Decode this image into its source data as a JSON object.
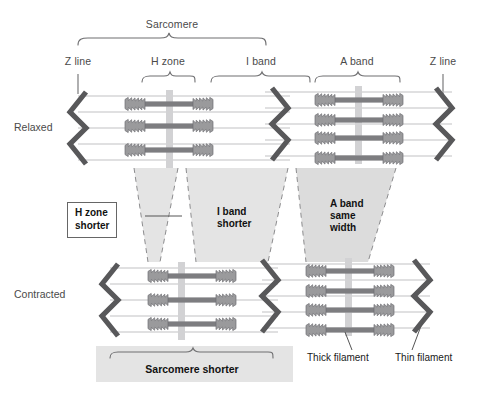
{
  "figure": {
    "top_label": "Sarcomere",
    "region_labels": {
      "z_line_left": "Z line",
      "h_zone": "H zone",
      "i_band": "I band",
      "a_band": "A band",
      "z_line_right": "Z line"
    },
    "row_labels": {
      "relaxed": "Relaxed",
      "contracted": "Contracted"
    },
    "callouts": [
      {
        "id": "h-zone-shorter",
        "text_line1": "H zone",
        "text_line2": "shorter",
        "boxed": true
      },
      {
        "id": "i-band-shorter",
        "text_line1": "I band",
        "text_line2": "shorter",
        "boxed": false
      },
      {
        "id": "a-band-same-width",
        "text_line1": "A band",
        "text_line2": "same",
        "text_line3": "width",
        "boxed": false
      }
    ],
    "bottom_labels": {
      "sarcomere_shorter": "Sarcomere shorter",
      "thick_filament": "Thick filament",
      "thin_filament": "Thin filament"
    },
    "colors": {
      "background": "#ffffff",
      "z_line": "#58585a",
      "thick_filament": "#7d7d80",
      "thin_filament": "#b9b9bb",
      "m_line": "#cfcfd1",
      "shade_band": "#e2e2e2",
      "bracket": "#6e6e70",
      "text": "#4a4a4a",
      "callout_text": "#111111"
    }
  }
}
